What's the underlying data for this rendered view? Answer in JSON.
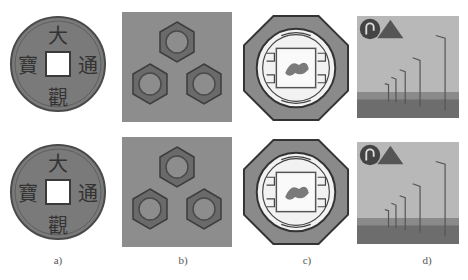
{
  "figure": {
    "captions": [
      "a)",
      "b)",
      "c)",
      "d)"
    ],
    "rows": [
      {
        "row": "top",
        "panels": [
          "coin",
          "hex-nuts",
          "octagon-ornament",
          "street-scene"
        ]
      },
      {
        "row": "bottom",
        "panels": [
          "coin",
          "hex-nuts",
          "octagon-ornament",
          "street-scene"
        ]
      }
    ],
    "coin_characters": {
      "top": "大",
      "left": "寶",
      "right": "通",
      "bottom": "觀"
    }
  }
}
